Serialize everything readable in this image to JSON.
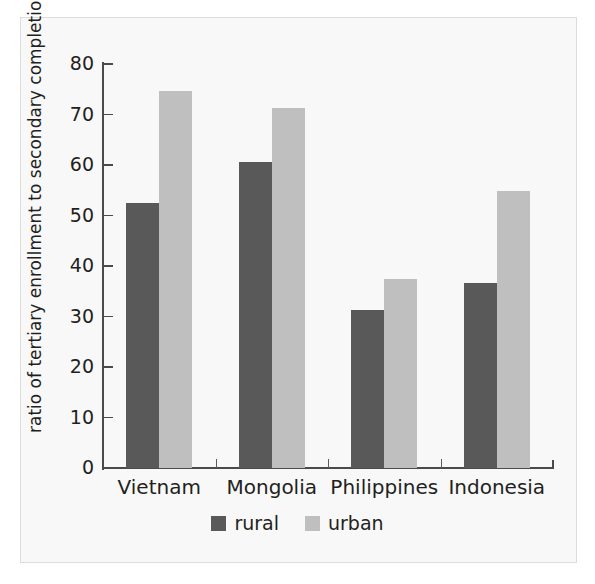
{
  "chart_data": {
    "type": "bar",
    "title": "",
    "subtitle": "",
    "xlabel": "",
    "ylabel": "ratio of tertiary enrollment to secondary completion",
    "categories": [
      "Vietnam",
      "Mongolia",
      "Philippines",
      "Indonesia"
    ],
    "series": [
      {
        "name": "rural",
        "color": "#595959",
        "values": [
          52.5,
          60.6,
          31.3,
          36.6
        ]
      },
      {
        "name": "urban",
        "color": "#bfbfbf",
        "values": [
          74.7,
          71.2,
          37.4,
          54.8
        ]
      }
    ],
    "ylim": [
      0,
      80
    ],
    "ytick_values": [
      0,
      10,
      20,
      30,
      40,
      50,
      60,
      70,
      80
    ],
    "ytick_labels": [
      "0",
      "10",
      "20",
      "30",
      "40",
      "50",
      "60",
      "70",
      "80"
    ],
    "grid": false,
    "legend": {
      "position": "bottom-center",
      "entries": [
        {
          "label": "rural",
          "color": "#595959"
        },
        {
          "label": "urban",
          "color": "#bfbfbf"
        }
      ]
    },
    "axis_color": "#4a4a4a",
    "background_color": "#f8f8f8"
  }
}
